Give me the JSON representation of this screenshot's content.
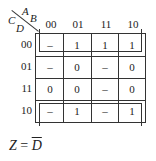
{
  "kmap": {
    "corner": {
      "col_vars": "AB",
      "row_vars": "CD",
      "col_var_a": "A",
      "col_var_b": "B",
      "row_var_c": "C",
      "row_var_d": "D"
    },
    "col_headers": [
      "00",
      "01",
      "11",
      "10"
    ],
    "row_headers": [
      "00",
      "01",
      "11",
      "10"
    ],
    "cells": [
      [
        "–",
        "1",
        "1",
        "1"
      ],
      [
        "–",
        "0",
        "–",
        "0"
      ],
      [
        "0",
        "0",
        "–",
        "0"
      ],
      [
        "–",
        "1",
        "–",
        "1"
      ]
    ],
    "groupings": [
      {
        "rows": [
          "00"
        ],
        "description": "loop around row CD=00 (wraps to row 10)"
      },
      {
        "rows": [
          "10"
        ],
        "description": "loop around row CD=10"
      }
    ]
  },
  "result": {
    "lhs": "Z",
    "equals": "=",
    "rhs": "D",
    "rhs_negated": true
  }
}
